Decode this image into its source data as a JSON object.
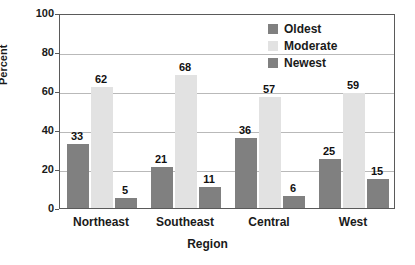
{
  "chart_data": {
    "type": "bar",
    "title": "",
    "xlabel": "Region",
    "ylabel": "Percent",
    "categories": [
      "Northeast",
      "Southeast",
      "Central",
      "West"
    ],
    "series": [
      {
        "name": "Oldest",
        "values": [
          33,
          21,
          36,
          25
        ],
        "color": "#808080"
      },
      {
        "name": "Moderate",
        "values": [
          62,
          68,
          57,
          59
        ],
        "color": "#e2e2e2"
      },
      {
        "name": "Newest",
        "values": [
          5,
          11,
          6,
          15
        ],
        "color": "#808080"
      }
    ],
    "ylim": [
      0,
      100
    ],
    "yticks": [
      0,
      20,
      40,
      60,
      80,
      100
    ],
    "ytick_labels": [
      "0",
      "20",
      "40",
      "60",
      "80",
      "100"
    ],
    "grid": true,
    "legend_position": "top-right",
    "show_value_labels": true
  },
  "axes": {
    "y_title": "Percent",
    "x_title": "Region"
  },
  "legend": {
    "entries": [
      {
        "label": "Oldest"
      },
      {
        "label": "Moderate"
      },
      {
        "label": "Newest"
      }
    ]
  }
}
